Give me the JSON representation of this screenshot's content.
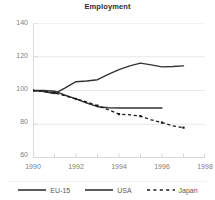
{
  "chart_data": {
    "type": "line",
    "title": "Employment",
    "xlabel": "",
    "ylabel": "",
    "xlim": [
      1990,
      1998
    ],
    "ylim": [
      60,
      140
    ],
    "grid": true,
    "legend_position": "bottom",
    "x_ticks": [
      "1990",
      "1992",
      "1994",
      "1996",
      "1998"
    ],
    "x_tick_values": [
      1990,
      1992,
      1994,
      1996,
      1998
    ],
    "y_ticks": [
      "60",
      "80",
      "100",
      "120",
      "140"
    ],
    "y_tick_values": [
      60,
      80,
      100,
      120,
      140
    ],
    "series": [
      {
        "name": "EU-15",
        "style": "solid",
        "color": "#333333",
        "x": [
          1990,
          1990.5,
          1991,
          1991.5,
          1992,
          1992.5,
          1993,
          1993.5,
          1994,
          1995,
          1996
        ],
        "values": [
          100,
          100,
          99.6,
          97.2,
          95,
          92.6,
          90.4,
          89.8,
          89.6,
          89.6,
          89.6
        ]
      },
      {
        "name": "USA",
        "style": "solid",
        "color": "#333333",
        "x": [
          1990,
          1990.5,
          1991,
          1991.5,
          1992,
          1992.5,
          1993,
          1993.5,
          1994,
          1994.5,
          1995,
          1995.5,
          1996,
          1996.5,
          1997
        ],
        "values": [
          100,
          99.4,
          98.2,
          101.5,
          105.2,
          105.6,
          106.4,
          109.6,
          112.4,
          114.6,
          116.2,
          115.2,
          114.0,
          114.2,
          114.6
        ]
      },
      {
        "name": "Japan",
        "style": "dashed",
        "color": "#1a1a1a",
        "x": [
          1990,
          1990.5,
          1991,
          1991.5,
          1992,
          1992.5,
          1993,
          1993.5,
          1994,
          1994.5,
          1995,
          1995.5,
          1996,
          1996.5,
          1997
        ],
        "values": [
          100,
          99.4,
          98.6,
          96.8,
          95,
          93.2,
          91,
          88.6,
          86,
          85.6,
          84.8,
          82.6,
          81,
          79,
          78
        ]
      }
    ]
  },
  "legend": {
    "items": [
      {
        "label": "EU-15",
        "key": "solid-line-key"
      },
      {
        "label": "USA",
        "key": "solid-line-key"
      },
      {
        "label": "Japan",
        "key": "dashed-line-key"
      }
    ]
  },
  "colors": {
    "line": "#333333",
    "grid": "#e8e8e8",
    "axis": "#d9d9d9",
    "tick_text": "#808080",
    "title_text": "#2b2b2b"
  }
}
